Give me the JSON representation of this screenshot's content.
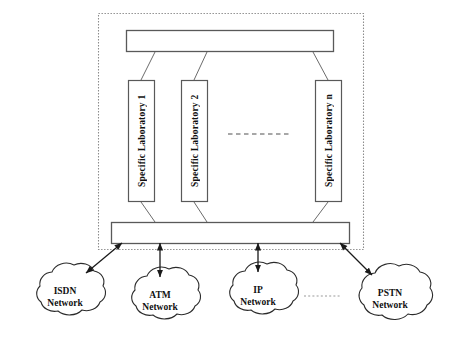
{
  "diagram": {
    "type": "block-diagram",
    "colors": {
      "stroke": "#4d4d4d",
      "box_fill": "#ffffff",
      "dotted_border": "#8c8c8c",
      "text": "#111111",
      "arrow": "#1a1a1a"
    },
    "container": {
      "name": "platform-boundary",
      "style": "dotted",
      "x": 98,
      "y": 13,
      "width": 266,
      "height": 237
    },
    "bars": [
      {
        "id": "top-bus",
        "label": "",
        "x": 126,
        "y": 30,
        "width": 208,
        "height": 22
      },
      {
        "id": "bottom-bus",
        "label": "",
        "x": 111,
        "y": 222,
        "width": 239,
        "height": 22
      }
    ],
    "laboratories": [
      {
        "id": "lab-1",
        "label": "Specific Laboratory  1",
        "x": 128,
        "y": 80,
        "width": 27,
        "height": 122
      },
      {
        "id": "lab-2",
        "label": "Specific Laboratory  2",
        "x": 181,
        "y": 80,
        "width": 27,
        "height": 122
      },
      {
        "id": "lab-n",
        "label": "Specific Laboratory  n",
        "x": 315,
        "y": 80,
        "width": 27,
        "height": 122
      }
    ],
    "ellipsis": {
      "id": "lab-ellipsis",
      "style": "dashed-horizontal",
      "x1": 228,
      "x2": 292,
      "y": 134
    },
    "networks": [
      {
        "id": "isdn",
        "label": "ISDN\nNetwork",
        "cx": 65,
        "cy": 298,
        "rx": 41,
        "ry": 31
      },
      {
        "id": "atm",
        "label": "ATM\nNetwork",
        "cx": 160,
        "cy": 302,
        "rx": 41,
        "ry": 31
      },
      {
        "id": "ip",
        "label": "IP\nNetwork",
        "cx": 258,
        "cy": 297,
        "rx": 41,
        "ry": 31
      },
      {
        "id": "pstn",
        "label": "PSTN\nNetwork",
        "cx": 390,
        "cy": 300,
        "rx": 44,
        "ry": 32
      }
    ],
    "links": [
      {
        "id": "bus-to-isdn",
        "from": "bottom-bus",
        "to": "isdn",
        "arrows": "both",
        "style": "solid-diagonal"
      },
      {
        "id": "bus-to-atm",
        "from": "bottom-bus",
        "to": "atm",
        "arrows": "both",
        "style": "solid-vertical"
      },
      {
        "id": "bus-to-ip",
        "from": "bottom-bus",
        "to": "ip",
        "arrows": "both",
        "style": "solid-vertical"
      },
      {
        "id": "bus-to-pstn",
        "from": "bottom-bus",
        "to": "pstn",
        "arrows": "both",
        "style": "solid-diagonal"
      },
      {
        "id": "ip-to-pstn",
        "from": "ip",
        "to": "pstn",
        "arrows": "none",
        "style": "dotted"
      }
    ],
    "connectors": [
      {
        "id": "top-bus-to-lab-1",
        "style": "plain-line"
      },
      {
        "id": "top-bus-to-lab-2",
        "style": "plain-line"
      },
      {
        "id": "top-bus-to-lab-n",
        "style": "plain-line"
      },
      {
        "id": "lab-1-to-bottom-bus",
        "style": "plain-line"
      },
      {
        "id": "lab-2-to-bottom-bus",
        "style": "plain-line"
      },
      {
        "id": "lab-n-to-bottom-bus",
        "style": "plain-line"
      }
    ]
  }
}
